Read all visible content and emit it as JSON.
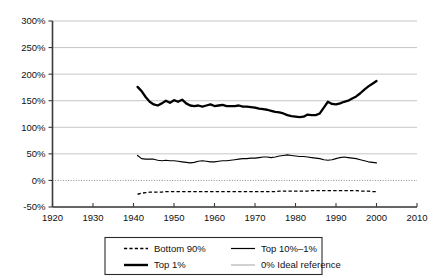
{
  "chart_data": {
    "type": "line",
    "title": "",
    "subtitle": "",
    "xlabel": "",
    "ylabel": "",
    "xlim": [
      1920,
      2010
    ],
    "ylim": [
      -50,
      300
    ],
    "grid": true,
    "legend_position": "bottom",
    "x_ticks": [
      "1920",
      "1930",
      "1940",
      "1950",
      "1960",
      "1970",
      "1980",
      "1990",
      "2000",
      "2010"
    ],
    "y_ticks": [
      "-50%",
      "0%",
      "50%",
      "100%",
      "150%",
      "200%",
      "250%",
      "300%"
    ],
    "x_tick_values": [
      1920,
      1930,
      1940,
      1950,
      1960,
      1970,
      1980,
      1990,
      2000,
      2010
    ],
    "y_tick_values": [
      -50,
      0,
      50,
      100,
      150,
      200,
      250,
      300
    ],
    "reference_line": {
      "label": "0% Ideal reference",
      "value": 0
    },
    "x": [
      1941,
      1942,
      1943,
      1944,
      1945,
      1946,
      1947,
      1948,
      1949,
      1950,
      1951,
      1952,
      1953,
      1954,
      1955,
      1956,
      1957,
      1958,
      1959,
      1960,
      1961,
      1962,
      1963,
      1964,
      1965,
      1966,
      1967,
      1968,
      1969,
      1970,
      1971,
      1972,
      1973,
      1974,
      1975,
      1976,
      1977,
      1978,
      1979,
      1980,
      1981,
      1982,
      1983,
      1984,
      1985,
      1986,
      1987,
      1988,
      1989,
      1990,
      1991,
      1992,
      1993,
      1994,
      1995,
      1996,
      1997,
      1998,
      1999,
      2000
    ],
    "series": [
      {
        "name": "Top 1%",
        "style": "solid-thick",
        "values": [
          176,
          168,
          157,
          148,
          143,
          141,
          145,
          150,
          146,
          151,
          148,
          152,
          145,
          141,
          140,
          141,
          139,
          141,
          143,
          140,
          141,
          142,
          140,
          140,
          140,
          141,
          139,
          139,
          138,
          137,
          135,
          134,
          133,
          131,
          129,
          128,
          126,
          123,
          121,
          120,
          119,
          120,
          124,
          123,
          123,
          126,
          137,
          148,
          144,
          143,
          145,
          148,
          150,
          154,
          158,
          164,
          171,
          177,
          182,
          187
        ]
      },
      {
        "name": "Top 10%–1%",
        "style": "solid-thin",
        "values": [
          47,
          41,
          40,
          40,
          40,
          38,
          37,
          38,
          37,
          37,
          36,
          35,
          34,
          33,
          34,
          36,
          37,
          36,
          35,
          35,
          36,
          37,
          37,
          38,
          39,
          40,
          41,
          41,
          42,
          42,
          43,
          44,
          44,
          43,
          44,
          46,
          47,
          48,
          47,
          46,
          45,
          45,
          44,
          43,
          42,
          41,
          39,
          38,
          39,
          41,
          43,
          44,
          43,
          42,
          41,
          39,
          37,
          35,
          34,
          33
        ]
      },
      {
        "name": "Bottom 90%",
        "style": "dashed",
        "values": [
          -26,
          -24,
          -23,
          -22,
          -22,
          -22,
          -22,
          -21,
          -21,
          -21,
          -21,
          -21,
          -21,
          -21,
          -21,
          -21,
          -21,
          -21,
          -21,
          -21,
          -21,
          -21,
          -21,
          -21,
          -21,
          -21,
          -21,
          -21,
          -21,
          -21,
          -21,
          -21,
          -21,
          -21,
          -21,
          -20,
          -20,
          -20,
          -20,
          -20,
          -20,
          -20,
          -20,
          -19,
          -19,
          -19,
          -19,
          -19,
          -19,
          -19,
          -19,
          -19,
          -19,
          -19,
          -19,
          -20,
          -20,
          -20,
          -21,
          -21
        ]
      }
    ]
  },
  "legend": {
    "entries": [
      {
        "label": "Bottom 90%",
        "style": "dashed"
      },
      {
        "label": "Top 10%–1%",
        "style": "solid-thin"
      },
      {
        "label": "Top 1%",
        "style": "solid-thick"
      },
      {
        "label": "0% Ideal reference",
        "style": "grey-thin"
      }
    ]
  }
}
